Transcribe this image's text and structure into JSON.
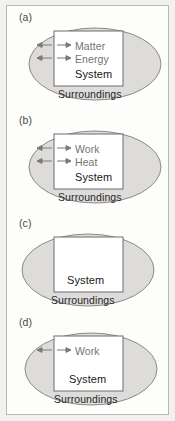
{
  "figure": {
    "background_color": "#f2f1ef",
    "frame_color": "#b9b7b4",
    "ellipse_fill": "#dedcda",
    "ellipse_stroke": "#8c8a87",
    "box_fill": "#ffffff",
    "box_stroke": "#6f6d6a",
    "arrow_color": "#7c7a77",
    "flow_label_color": "#76736f",
    "system_label_color": "#17171a"
  },
  "panels": [
    {
      "label": "(a)",
      "system_label": "System",
      "surroundings_label": "Surroundings",
      "flows": [
        "Matter",
        "Energy"
      ],
      "arrow_count": 2
    },
    {
      "label": "(b)",
      "system_label": "System",
      "surroundings_label": "Surroundings",
      "flows": [
        "Work",
        "Heat"
      ],
      "arrow_count": 2
    },
    {
      "label": "(c)",
      "system_label": "System",
      "surroundings_label": "Surroundings",
      "flows": [],
      "arrow_count": 0
    },
    {
      "label": "(d)",
      "system_label": "System",
      "surroundings_label": "Surroundings",
      "flows": [
        "Work"
      ],
      "arrow_count": 1
    }
  ]
}
